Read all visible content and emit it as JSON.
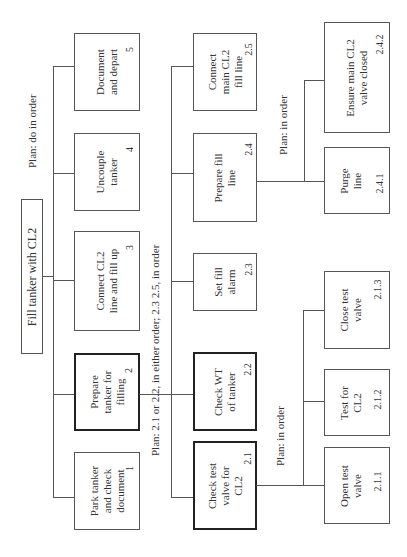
{
  "root": {
    "label": "Fill tanker with CL2"
  },
  "plans": {
    "p0": "Plan: do in order",
    "p2": "Plan: 2.1 or 2.2, in either order; 2.3 2.5, in order",
    "p24": "Plan: in order",
    "p21": "Plan: in order"
  },
  "tasks": {
    "t1": {
      "label_lines": [
        "Park tanker",
        "and check",
        "document"
      ],
      "number": "1"
    },
    "t2": {
      "label_lines": [
        "Prepare",
        "tanker for",
        "filling"
      ],
      "number": "2"
    },
    "t3": {
      "label_lines": [
        "Connect CL2",
        "line and fill up"
      ],
      "number": "3"
    },
    "t4": {
      "label_lines": [
        "Uncouple",
        "tanker"
      ],
      "number": "4"
    },
    "t5": {
      "label_lines": [
        "Document",
        "and depart"
      ],
      "number": "5"
    },
    "t21": {
      "label_lines": [
        "Check test",
        "valve for",
        "CL2"
      ],
      "number": "2.1"
    },
    "t22": {
      "label_lines": [
        "Check WT",
        "of tanker"
      ],
      "number": "2.2"
    },
    "t23": {
      "label_lines": [
        "Set fill",
        "alarm"
      ],
      "number": "2.3"
    },
    "t24": {
      "label_lines": [
        "Prepare fill",
        "line"
      ],
      "number": "2.4"
    },
    "t25": {
      "label_lines": [
        "Connect",
        "main CL2",
        "fill line"
      ],
      "number": "2.5"
    },
    "t211": {
      "label_lines": [
        "Open test",
        "valve"
      ],
      "number": "2.1.1"
    },
    "t212": {
      "label_lines": [
        "Test for",
        "CL2"
      ],
      "number": "2.1.2"
    },
    "t213": {
      "label_lines": [
        "Close test",
        "valve"
      ],
      "number": "2.1.3"
    },
    "t241": {
      "label_lines": [
        "Purge",
        "line"
      ],
      "number": "2.4.1"
    },
    "t242": {
      "label_lines": [
        "Ensure main CL2",
        "valve closed"
      ],
      "number": "2.4.2"
    }
  }
}
